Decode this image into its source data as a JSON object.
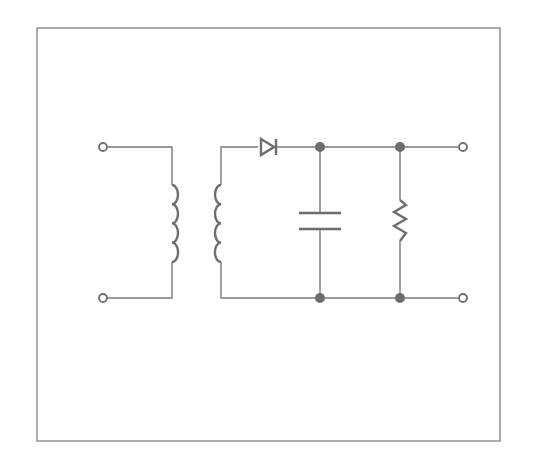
{
  "diagram": {
    "components": [
      {
        "id": "T1",
        "type": "transformer",
        "label": "transformer"
      },
      {
        "id": "D1",
        "type": "diode",
        "label": "diode"
      },
      {
        "id": "C1",
        "type": "capacitor",
        "label": "capacitor"
      },
      {
        "id": "R1",
        "type": "resistor",
        "label": "resistor"
      }
    ],
    "terminals": [
      "input-top",
      "input-bottom",
      "output-top",
      "output-bottom"
    ],
    "colors": {
      "line": "#7a7a7a",
      "node": "#6e6e6e",
      "frame": "#8a8a8a",
      "background": "#ffffff"
    }
  }
}
